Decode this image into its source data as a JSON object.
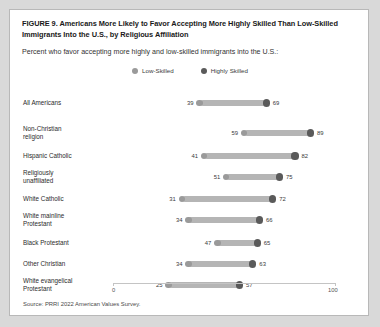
{
  "figure": {
    "title": "FIGURE 9.  Americans More Likely to Favor Accepting More Highly Skilled Than Low-Skilled Immigrants Into the U.S., by Religious Affiliation",
    "subtitle": "Percent who favor accepting more highly and low-skilled immigrants into the U.S.:",
    "source": "Source: PRRI 2022 American Values Survey."
  },
  "legend": {
    "items": [
      {
        "label": "Low-Skilled",
        "color": "#9a9a9a"
      },
      {
        "label": "Highly Skilled",
        "color": "#5a5a5a"
      }
    ]
  },
  "axis": {
    "ticks": [
      "0",
      "100"
    ],
    "min": 0,
    "max": 100
  },
  "colors": {
    "low_skilled": "#9a9a9a",
    "highly_skilled": "#5a5a5a",
    "connector": "#b5b5b5",
    "card_background": "#ffffff",
    "page_background": "#d9d9d9"
  },
  "chart_data": {
    "type": "bar",
    "subtype": "dumbbell-dot-plot",
    "title": "FIGURE 9.  Americans More Likely to Favor Accepting More Highly Skilled Than Low-Skilled Immigrants Into the U.S., by Religious Affiliation",
    "subtitle": "Percent who favor accepting more highly and low-skilled immigrants into the U.S.:",
    "xlabel": "",
    "ylabel": "",
    "xlim": [
      0,
      100
    ],
    "grid": false,
    "legend_position": "top-center",
    "categories": [
      "All Americans",
      "Non-Christian religion",
      "Hispanic Catholic",
      "Religiously unaffiliated",
      "White Catholic",
      "White mainline Protestant",
      "Black Protestant",
      "Other Christian",
      "White evangelical Protestant"
    ],
    "series": [
      {
        "name": "Low-Skilled",
        "color": "#9a9a9a",
        "values": [
          39,
          59,
          41,
          51,
          31,
          34,
          47,
          34,
          25
        ]
      },
      {
        "name": "Highly Skilled",
        "color": "#5a5a5a",
        "values": [
          69,
          89,
          82,
          75,
          72,
          66,
          65,
          63,
          57
        ]
      }
    ],
    "rows": [
      {
        "label": "All Americans",
        "label_lines": [
          "All Americans"
        ],
        "low": 39,
        "high": 69
      },
      {
        "label": "Non-Christian religion",
        "label_lines": [
          "Non-Christian",
          "religion"
        ],
        "low": 59,
        "high": 89
      },
      {
        "label": "Hispanic Catholic",
        "label_lines": [
          "Hispanic Catholic"
        ],
        "low": 41,
        "high": 82
      },
      {
        "label": "Religiously unaffiliated",
        "label_lines": [
          "Religiously",
          "unaffiliated"
        ],
        "low": 51,
        "high": 75
      },
      {
        "label": "White Catholic",
        "label_lines": [
          "White Catholic"
        ],
        "low": 31,
        "high": 72
      },
      {
        "label": "White mainline Protestant",
        "label_lines": [
          "White mainline",
          "Protestant"
        ],
        "low": 34,
        "high": 66
      },
      {
        "label": "Black Protestant",
        "label_lines": [
          "Black Protestant"
        ],
        "low": 47,
        "high": 65
      },
      {
        "label": "Other Christian",
        "label_lines": [
          "Other Christian"
        ],
        "low": 34,
        "high": 63
      },
      {
        "label": "White evangelical Protestant",
        "label_lines": [
          "White evangelical",
          "Protestant"
        ],
        "low": 25,
        "high": 57
      }
    ]
  }
}
